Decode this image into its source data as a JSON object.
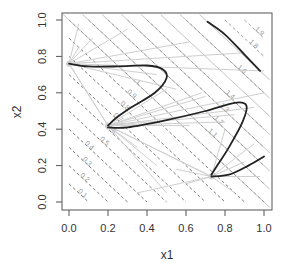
{
  "chart_data": {
    "type": "line",
    "title": "",
    "xlabel": "x1",
    "ylabel": "x2",
    "xlim": [
      0.0,
      1.0
    ],
    "ylim": [
      0.0,
      1.0
    ],
    "x_ticks": [
      "0.0",
      "0.2",
      "0.4",
      "0.6",
      "0.8",
      "1.0"
    ],
    "y_ticks": [
      "0.0",
      "0.2",
      "0.4",
      "0.6",
      "0.8",
      "1.0"
    ],
    "grid": false,
    "legend": null,
    "contours": {
      "description": "Level lines of x1 + x2 = c",
      "levels_dashed": [
        0.1,
        0.2,
        0.3,
        0.4,
        0.5,
        0.6,
        0.7,
        0.8,
        0.9,
        1.0,
        1.1,
        1.2,
        1.3,
        1.4,
        1.6,
        1.8,
        1.9
      ],
      "levels_solid_light": [
        1.0,
        1.1,
        1.2,
        1.3,
        1.4,
        1.5,
        1.6,
        1.7
      ]
    },
    "focal_points": [
      {
        "x1": 0.0,
        "x2": 0.76
      },
      {
        "x1": 0.2,
        "x2": 0.42
      },
      {
        "x1": 0.73,
        "x2": 0.14
      }
    ],
    "series": [
      {
        "name": "curve-1",
        "color": "#222222",
        "points": [
          [
            0.0,
            0.76
          ],
          [
            0.1,
            0.745
          ],
          [
            0.25,
            0.745
          ],
          [
            0.4,
            0.75
          ],
          [
            0.48,
            0.73
          ],
          [
            0.5,
            0.68
          ],
          [
            0.44,
            0.6
          ],
          [
            0.32,
            0.52
          ],
          [
            0.24,
            0.46
          ],
          [
            0.2,
            0.42
          ]
        ]
      },
      {
        "name": "curve-2",
        "color": "#222222",
        "points": [
          [
            0.2,
            0.41
          ],
          [
            0.3,
            0.41
          ],
          [
            0.5,
            0.45
          ],
          [
            0.7,
            0.5
          ],
          [
            0.85,
            0.545
          ],
          [
            0.91,
            0.53
          ],
          [
            0.89,
            0.44
          ],
          [
            0.82,
            0.3
          ],
          [
            0.76,
            0.2
          ],
          [
            0.73,
            0.15
          ]
        ]
      },
      {
        "name": "curve-3",
        "color": "#222222",
        "points": [
          [
            0.73,
            0.14
          ],
          [
            0.82,
            0.15
          ],
          [
            0.92,
            0.2
          ],
          [
            1.0,
            0.25
          ]
        ]
      },
      {
        "name": "curve-4",
        "color": "#222222",
        "points": [
          [
            0.71,
            0.99
          ],
          [
            0.8,
            0.92
          ],
          [
            0.9,
            0.81
          ],
          [
            0.98,
            0.72
          ]
        ]
      }
    ]
  },
  "axes": {
    "xlabel": "x1",
    "ylabel": "x2"
  }
}
